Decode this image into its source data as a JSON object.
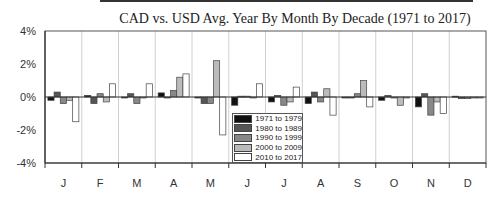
{
  "chart_data": {
    "type": "bar",
    "title": "CAD vs. USD Avg. Year By Month By Decade (1971 to 2017)",
    "xlabel": "",
    "ylabel": "",
    "ylim": [
      -4,
      4
    ],
    "yticks": [
      "4%",
      "2%",
      "0%",
      "-2%",
      "-4%"
    ],
    "grid": "vertical",
    "legend_position": "inside-bottom-center",
    "categories": [
      "J",
      "F",
      "M",
      "A",
      "M",
      "J",
      "J",
      "A",
      "S",
      "O",
      "N",
      "D"
    ],
    "series": [
      {
        "name": "1971 to 1979",
        "color": "#111111",
        "values": [
          -0.2,
          0.1,
          -0.05,
          0.25,
          0.0,
          -0.5,
          -0.3,
          -0.4,
          -0.05,
          -0.2,
          -0.6,
          0.05
        ]
      },
      {
        "name": "1980 to 1989",
        "color": "#555555",
        "values": [
          0.3,
          -0.4,
          0.2,
          0.0,
          -0.4,
          0.05,
          0.1,
          0.3,
          -0.05,
          0.1,
          0.2,
          -0.1
        ]
      },
      {
        "name": "1990 to 1999",
        "color": "#888888",
        "values": [
          -0.4,
          0.2,
          -0.4,
          0.4,
          -0.4,
          0.05,
          -0.5,
          -0.3,
          0.2,
          -0.05,
          -1.1,
          -0.1
        ]
      },
      {
        "name": "2000 to 2009",
        "color": "#bbbbbb",
        "values": [
          -0.2,
          -0.3,
          -0.05,
          1.2,
          2.2,
          -0.05,
          -0.3,
          0.5,
          1.0,
          -0.5,
          -0.3,
          -0.05
        ]
      },
      {
        "name": "2010 to 2017",
        "color": "#ffffff",
        "values": [
          -1.5,
          0.8,
          0.8,
          1.4,
          -2.3,
          0.8,
          0.6,
          -1.1,
          -0.6,
          -0.05,
          -1.0,
          -0.05
        ]
      }
    ]
  }
}
